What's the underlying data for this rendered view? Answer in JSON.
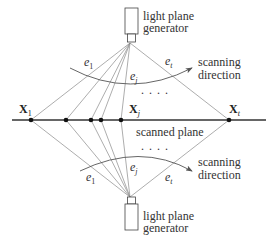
{
  "diagram": {
    "top_generator": {
      "label_line1": "light plane",
      "label_line2": "generator"
    },
    "bottom_generator": {
      "label_line1": "light plane",
      "label_line2": "generator"
    },
    "top_arrow": {
      "label_line1": "scanning",
      "label_line2": "direction"
    },
    "bottom_arrow": {
      "label_line1": "scanning",
      "label_line2": "direction"
    },
    "plane_label": "scanned plane",
    "ellipsis": ". . . .",
    "points": [
      {
        "symbol": "X",
        "sub": "1"
      },
      {
        "symbol": "X",
        "sub": "j"
      },
      {
        "symbol": "X",
        "sub": "t"
      }
    ],
    "top_rays": [
      {
        "symbol": "e",
        "sub": "1"
      },
      {
        "symbol": "e",
        "sub": "j"
      },
      {
        "symbol": "e",
        "sub": "t"
      }
    ],
    "bottom_rays": [
      {
        "symbol": "e",
        "sub": "1"
      },
      {
        "symbol": "e",
        "sub": "j"
      },
      {
        "symbol": "e",
        "sub": "t"
      }
    ],
    "colors": {
      "line": "#333333",
      "ray": "#888888",
      "dot": "#111111"
    }
  }
}
